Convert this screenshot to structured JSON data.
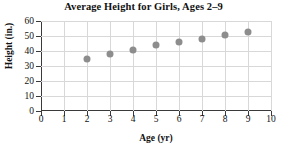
{
  "chart_data": {
    "type": "scatter",
    "title": "Average Height for Girls, Ages 2–9",
    "xlabel": "Age (yr)",
    "ylabel": "Height (in.)",
    "x": [
      2,
      3,
      4,
      5,
      6,
      7,
      8,
      9
    ],
    "values": [
      35,
      38,
      41,
      44,
      46,
      48,
      51,
      53
    ],
    "series": [
      {
        "name": "Average height",
        "values": [
          35,
          38,
          41,
          44,
          46,
          48,
          51,
          53
        ]
      }
    ],
    "xlim": [
      0,
      10
    ],
    "ylim": [
      0,
      60
    ],
    "x_ticks": [
      0,
      1,
      2,
      3,
      4,
      5,
      6,
      7,
      8,
      9,
      10
    ],
    "x_tick_labels": [
      "0",
      "1",
      "2",
      "3",
      "4",
      "5",
      "6",
      "7",
      "8",
      "9",
      "10"
    ],
    "y_ticks": [
      0,
      10,
      20,
      30,
      40,
      50,
      60
    ],
    "y_tick_labels": [
      "0",
      "10",
      "20",
      "30",
      "40",
      "50",
      "60"
    ],
    "grid": true,
    "legend": false,
    "marker_color": "#8d8d8d",
    "axis_color": "#3a3a3a",
    "grid_color": "#d8d8d8",
    "background_color": "#ffffff"
  }
}
